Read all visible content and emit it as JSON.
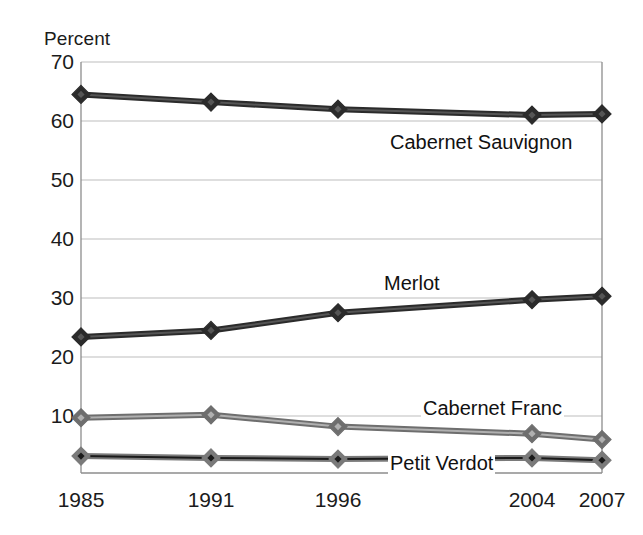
{
  "chart_data": {
    "type": "line",
    "title": "",
    "subtitle": "",
    "xlabel": "",
    "ylabel": "Percent",
    "categories": [
      "1985",
      "1991",
      "1996",
      "2004",
      "2007"
    ],
    "x": [
      1985,
      1991,
      1996,
      2004,
      2007
    ],
    "xtick_labels": [
      "1985",
      "1991",
      "1996",
      "2004",
      "2007"
    ],
    "ytick_labels": [
      "70",
      "60",
      "50",
      "40",
      "30",
      "20",
      "10"
    ],
    "yticks": [
      70,
      60,
      50,
      40,
      30,
      20,
      10
    ],
    "ylim": [
      1.5,
      70
    ],
    "xlim_mode": "categorical-uneven",
    "grid": "horizontal",
    "legend_position": "inline-annotations",
    "series": [
      {
        "name": "Cabernet Sauvignon",
        "values": [
          64.5,
          63.2,
          62.0,
          61.0,
          61.2
        ],
        "marker": "diamond",
        "marker_fill": "#555555",
        "line_color": "#2b2b2b"
      },
      {
        "name": "Merlot",
        "values": [
          23.4,
          24.5,
          27.5,
          29.7,
          30.3
        ],
        "marker": "diamond",
        "marker_fill": "#555555",
        "line_color": "#2b2b2b"
      },
      {
        "name": "Cabernet Franc",
        "values": [
          9.7,
          10.2,
          8.2,
          7.0,
          6.0
        ],
        "marker": "diamond",
        "marker_fill": "#b0b0b0",
        "line_color": "#6e6e6e"
      },
      {
        "name": "Petit Verdot",
        "values": [
          3.2,
          2.9,
          2.7,
          2.9,
          2.5
        ],
        "marker": "diamond",
        "marker_fill": "#1a1a1a",
        "line_color": "#7a7a7a"
      }
    ],
    "annotations": [
      {
        "text": "Cabernet Sauvignon",
        "x_px": 388,
        "y_px": 143
      },
      {
        "text": "Merlot",
        "x_px": 382,
        "y_px": 284
      },
      {
        "text": "Cabernet Franc",
        "x_px": 421,
        "y_px": 409
      },
      {
        "text": "Petit Verdot",
        "x_px": 388,
        "y_px": 463
      }
    ]
  },
  "colors": {
    "background": "#ffffff",
    "grid": "#bdbdbd",
    "axis": "#8d8d8d",
    "text": "#1b1b1b",
    "dark_series": "#2b2b2b",
    "light_series": "#9a9a9a"
  }
}
